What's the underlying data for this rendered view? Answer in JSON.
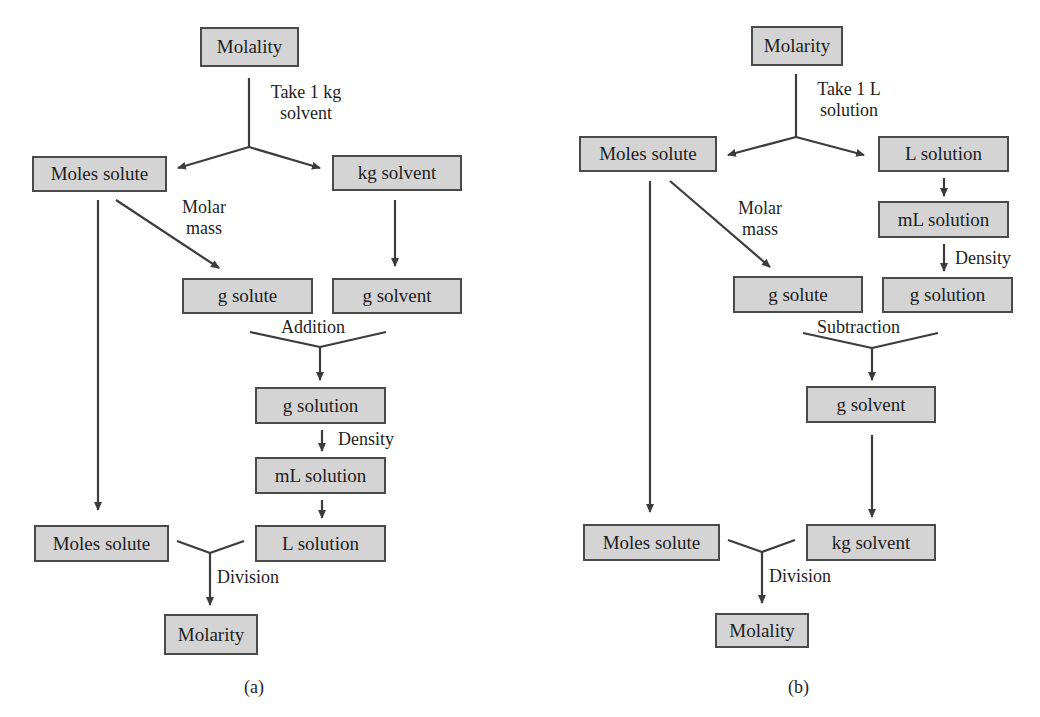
{
  "panel_a": {
    "caption": "(a)",
    "boxes": {
      "molality_top": "Molality",
      "moles_solute": "Moles solute",
      "kg_solvent": "kg solvent",
      "g_solute": "g solute",
      "g_solvent": "g solvent",
      "g_solution": "g solution",
      "ml_solution": "mL solution",
      "l_solution": "L solution",
      "moles_solute_bottom": "Moles solute",
      "molarity_result": "Molarity"
    },
    "labels": {
      "take_line1": "Take 1 kg",
      "take_line2": "solvent",
      "molar_line1": "Molar",
      "molar_line2": "mass",
      "addition": "Addition",
      "density": "Density",
      "division": "Division"
    }
  },
  "panel_b": {
    "caption": "(b)",
    "boxes": {
      "molarity_top": "Molarity",
      "moles_solute": "Moles solute",
      "l_solution": "L solution",
      "ml_solution": "mL solution",
      "g_solution": "g solution",
      "g_solute": "g solute",
      "g_solvent": "g solvent",
      "moles_solute_bottom": "Moles solute",
      "kg_solvent": "kg solvent",
      "molality_result": "Molality"
    },
    "labels": {
      "take_line1": "Take 1 L",
      "take_line2": "solution",
      "molar_line1": "Molar",
      "molar_line2": "mass",
      "subtraction": "Subtraction",
      "density": "Density",
      "division": "Division"
    }
  },
  "colors": {
    "box_fill": "#d4d4d4",
    "box_border": "#4a4a4a",
    "line": "#3c3c3c",
    "text": "#1e1e1e"
  }
}
